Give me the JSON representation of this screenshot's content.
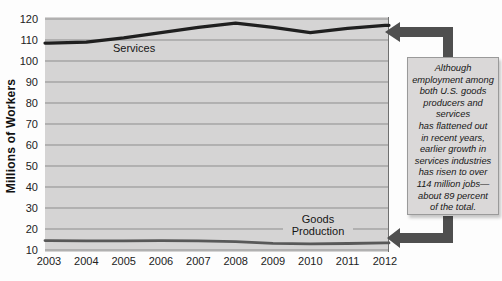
{
  "figure": {
    "y_axis_title": "Millions of Workers",
    "services_label": "Services",
    "goods_label_line1": "Goods",
    "goods_label_line2": "Production"
  },
  "annotation": {
    "text": "Although\nemployment among\nboth U.S. goods\nproducers and\nservices\nhas flattened out\nin recent years,\nearlier growth in\nservices industries\nhas risen to over\n114 million jobs—\nabout 89 percent\nof the total."
  },
  "colors": {
    "plot_background": "#d5d4d4",
    "gridline": "#8d8d8d",
    "plot_right_border": "#6f6f6f",
    "services_line": "#1f1f1f",
    "goods_line": "#585858",
    "arrow": "#4f4f4f",
    "callout_background": "#dad8d8",
    "callout_border": "#9a9a9a"
  },
  "chart_data": {
    "type": "line",
    "title": "",
    "xlabel": "",
    "ylabel": "Millions of Workers",
    "x": [
      2003,
      2004,
      2005,
      2006,
      2007,
      2008,
      2009,
      2010,
      2011,
      2012
    ],
    "series": [
      {
        "name": "Services",
        "values": [
          108.5,
          109,
          111,
          113.5,
          116,
          118,
          116,
          113.5,
          115.5,
          117
        ]
      },
      {
        "name": "Goods Production",
        "values": [
          14.5,
          14.4,
          14.4,
          14.5,
          14.4,
          14.0,
          13.2,
          12.9,
          13.1,
          13.4
        ]
      }
    ],
    "ylim": [
      10,
      120
    ],
    "yticks": [
      120,
      110,
      100,
      90,
      80,
      70,
      60,
      50,
      40,
      30,
      20,
      10
    ],
    "grid": true,
    "legend_position": "inline-labels",
    "annotations": [
      "Arrow from callout box to Services line end",
      "Arrow from callout box to Goods Production line end"
    ]
  }
}
